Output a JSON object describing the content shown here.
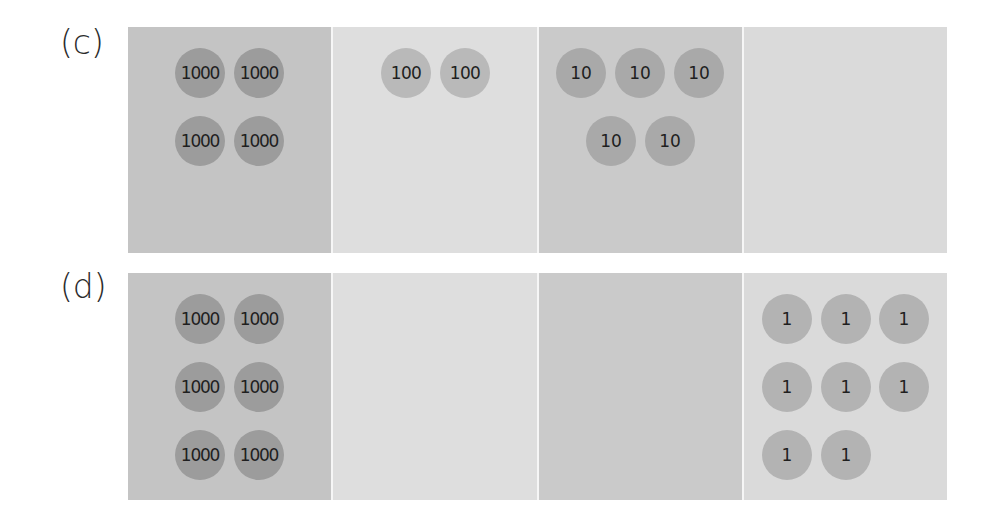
{
  "figure": {
    "panels": [
      {
        "label": "(c)",
        "columns": [
          {
            "place": "thousands",
            "bg": "#c4c4c4",
            "chips": [
              "1000",
              "1000",
              "1000",
              "1000"
            ]
          },
          {
            "place": "hundreds",
            "bg": "#dedede",
            "chips": [
              "100",
              "100"
            ]
          },
          {
            "place": "tens",
            "bg": "#cacaca",
            "chips": [
              "10",
              "10",
              "10",
              "10",
              "10"
            ]
          },
          {
            "place": "ones",
            "bg": "#dadada",
            "chips": []
          }
        ]
      },
      {
        "label": "(d)",
        "columns": [
          {
            "place": "thousands",
            "bg": "#c4c4c4",
            "chips": [
              "1000",
              "1000",
              "1000",
              "1000",
              "1000",
              "1000"
            ]
          },
          {
            "place": "hundreds",
            "bg": "#dedede",
            "chips": []
          },
          {
            "place": "tens",
            "bg": "#cacaca",
            "chips": []
          },
          {
            "place": "ones",
            "bg": "#dadada",
            "chips": [
              "1",
              "1",
              "1",
              "1",
              "1",
              "1",
              "1",
              "1"
            ]
          }
        ]
      }
    ],
    "colors": {
      "chip_thousands": "#9c9c9c",
      "chip_hundreds": "#b9b9b9",
      "chip_tens": "#a9a9a9",
      "chip_ones": "#b3b3b3"
    }
  }
}
